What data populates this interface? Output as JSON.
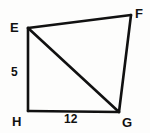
{
  "figure": {
    "name": "quadrilateral-efgh-with-diagonal",
    "type": "geometry-diagram",
    "background_color": "#fdfdfc",
    "stroke_color": "#111111",
    "label_color": "#111111",
    "vertices": [
      {
        "id": "E",
        "label": "E",
        "x": 28,
        "y": 28
      },
      {
        "id": "F",
        "label": "F",
        "x": 131,
        "y": 15
      },
      {
        "id": "G",
        "label": "G",
        "x": 119,
        "y": 112
      },
      {
        "id": "H",
        "label": "H",
        "x": 28,
        "y": 111
      }
    ],
    "edges": [
      {
        "id": "EF",
        "from": "E",
        "to": "F",
        "kind": "side"
      },
      {
        "id": "FG",
        "from": "F",
        "to": "G",
        "kind": "side"
      },
      {
        "id": "GH",
        "from": "G",
        "to": "H",
        "kind": "side"
      },
      {
        "id": "HE",
        "from": "H",
        "to": "E",
        "kind": "side"
      },
      {
        "id": "EG",
        "from": "E",
        "to": "G",
        "kind": "diagonal"
      }
    ],
    "measurements": [
      {
        "id": "EH",
        "edge": "HE",
        "value": "5",
        "position": "left"
      },
      {
        "id": "HG",
        "edge": "GH",
        "value": "12",
        "position": "bottom"
      }
    ]
  }
}
